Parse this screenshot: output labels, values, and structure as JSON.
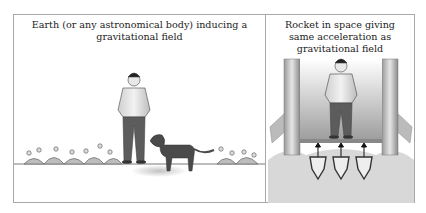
{
  "figure": {
    "panels": [
      {
        "id": "left",
        "caption": "Earth (or any astronomical body) inducing a gravitational field",
        "caption_lines": [
          "Earth (or any astronomical body) inducing a",
          "gravitational field"
        ],
        "scene": [
          "man-standing",
          "dog",
          "flowers",
          "ground-line"
        ]
      },
      {
        "id": "right",
        "caption": "Rocket in space giving same acceleration as gravitational field",
        "caption_lines": [
          "Rocket in space giving",
          "same acceleration as",
          "gravitational field"
        ],
        "scene": [
          "man-standing",
          "rocket-walls",
          "floor",
          "thrust-arrows",
          "rocket-nozzles",
          "exhaust-cloud"
        ]
      }
    ],
    "colors": {
      "border": "#a8a8a8",
      "ink": "#222222",
      "figure_gray": "#6a6a6a"
    }
  }
}
